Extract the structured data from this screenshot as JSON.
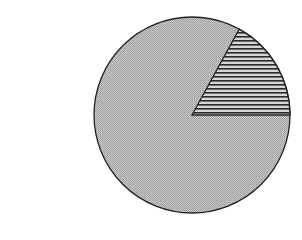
{
  "chart_data": {
    "type": "pie",
    "title": "",
    "labels": [
      "Major segment (stippled gray)",
      "Minor segment (horizontal hatch)"
    ],
    "values": [
      83,
      17
    ],
    "start_angle_deg": 0,
    "direction": "counterclockwise",
    "fills": [
      "stippled-gray",
      "horizontal-hatch"
    ],
    "colors": [
      "#b8b8b8",
      "#333333"
    ],
    "legend": "none",
    "center_px": [
      192,
      115
    ],
    "radius_px": 98
  }
}
